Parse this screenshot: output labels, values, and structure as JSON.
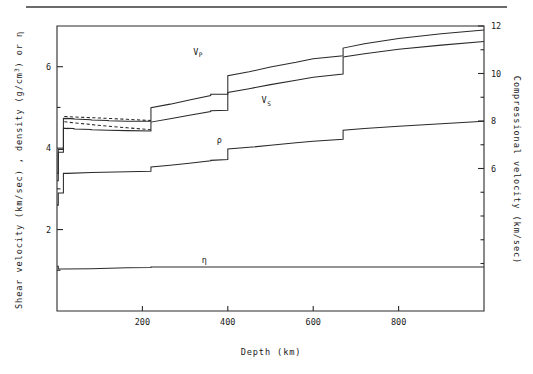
{
  "figure": {
    "background": "#ffffff",
    "ink": "#2a2a2a",
    "top_rule": true
  },
  "chart_data": {
    "type": "line",
    "title": "",
    "xlabel": "Depth (km)",
    "ylabel": "Shear velocity (km/sec) , density (g/cm3) or n",
    "ylabel_parts": {
      "a": "Shear velocity (km/sec) , density (g/cm",
      "sup": "3",
      "b": ") or ",
      "eta": "η"
    },
    "y2label": "Compressional velocity (km/sec)",
    "xlim": [
      0,
      1000
    ],
    "ylim": [
      0,
      7.0
    ],
    "y2lim": [
      0,
      12.0
    ],
    "grid": false,
    "legend": "inline-annotations",
    "xticks": [
      200,
      400,
      600,
      800
    ],
    "xticklabels": [
      "200",
      "400",
      "600",
      "800"
    ],
    "yticks": [
      2,
      4,
      6
    ],
    "yticklabels": [
      "2",
      "4",
      "6"
    ],
    "yminorticks": [
      1,
      3,
      5,
      7
    ],
    "y2ticks": [
      6,
      8,
      10,
      12
    ],
    "y2ticklabels": [
      "6",
      "8",
      "10",
      "12"
    ],
    "y2minorticks": [
      2,
      3,
      4,
      5,
      7,
      9,
      11
    ],
    "annotations": [
      {
        "name": "vp-label",
        "text": "V",
        "sub": "P",
        "x": 330,
        "y": 6.3
      },
      {
        "name": "vs-label",
        "text": "V",
        "sub": "S",
        "x": 490,
        "y": 5.1
      },
      {
        "name": "rho-label",
        "text": "ρ",
        "sub": "",
        "x": 380,
        "y": 4.12
      },
      {
        "name": "eta-label",
        "text": "η",
        "sub": "",
        "x": 345,
        "y": 1.18
      }
    ],
    "series": [
      {
        "name": "Compressional velocity Vp",
        "axis": "right",
        "label": "V_P",
        "style": "solid",
        "points": [
          [
            0,
            5.8
          ],
          [
            3,
            5.8
          ],
          [
            3,
            6.8
          ],
          [
            15,
            6.8
          ],
          [
            15,
            8.11
          ],
          [
            24.4,
            8.1
          ],
          [
            24.4,
            8.11
          ],
          [
            40,
            8.09
          ],
          [
            40,
            8.08
          ],
          [
            80,
            8.05
          ],
          [
            80,
            8.04
          ],
          [
            120,
            8.02
          ],
          [
            120,
            8.01
          ],
          [
            165,
            7.99
          ],
          [
            165,
            7.99
          ],
          [
            220,
            7.99
          ],
          [
            220,
            8.56
          ],
          [
            265,
            8.71
          ],
          [
            265,
            8.71
          ],
          [
            310,
            8.88
          ],
          [
            310,
            8.88
          ],
          [
            360,
            9.07
          ],
          [
            360,
            9.13
          ],
          [
            400,
            9.13
          ],
          [
            400,
            9.91
          ],
          [
            450,
            10.07
          ],
          [
            450,
            10.07
          ],
          [
            500,
            10.27
          ],
          [
            500,
            10.27
          ],
          [
            560,
            10.47
          ],
          [
            560,
            10.47
          ],
          [
            600,
            10.62
          ],
          [
            600,
            10.62
          ],
          [
            670,
            10.75
          ],
          [
            670,
            11.07
          ],
          [
            720,
            11.25
          ],
          [
            720,
            11.25
          ],
          [
            800,
            11.47
          ],
          [
            800,
            11.47
          ],
          [
            900,
            11.67
          ],
          [
            900,
            11.67
          ],
          [
            1000,
            11.83
          ]
        ]
      },
      {
        "name": "Compressional velocity Vp anisotropic (dashed)",
        "axis": "right",
        "label": "V_P horizontal",
        "style": "dashed",
        "points": [
          [
            17,
            8.19
          ],
          [
            40,
            8.17
          ],
          [
            80,
            8.14
          ],
          [
            120,
            8.11
          ],
          [
            165,
            8.07
          ],
          [
            220,
            8.02
          ]
        ]
      },
      {
        "name": "Shear velocity Vs",
        "axis": "left",
        "label": "V_S",
        "style": "solid",
        "points": [
          [
            0,
            3.2
          ],
          [
            3,
            3.2
          ],
          [
            3,
            3.9
          ],
          [
            15,
            3.9
          ],
          [
            15,
            4.49
          ],
          [
            24.4,
            4.48
          ],
          [
            24.4,
            4.49
          ],
          [
            40,
            4.48
          ],
          [
            40,
            4.47
          ],
          [
            80,
            4.46
          ],
          [
            80,
            4.45
          ],
          [
            120,
            4.44
          ],
          [
            120,
            4.44
          ],
          [
            165,
            4.43
          ],
          [
            165,
            4.43
          ],
          [
            220,
            4.42
          ],
          [
            220,
            4.64
          ],
          [
            265,
            4.72
          ],
          [
            265,
            4.72
          ],
          [
            310,
            4.81
          ],
          [
            310,
            4.81
          ],
          [
            360,
            4.9
          ],
          [
            360,
            4.92
          ],
          [
            400,
            4.93
          ],
          [
            400,
            5.37
          ],
          [
            450,
            5.46
          ],
          [
            450,
            5.46
          ],
          [
            500,
            5.56
          ],
          [
            500,
            5.56
          ],
          [
            560,
            5.67
          ],
          [
            560,
            5.67
          ],
          [
            600,
            5.74
          ],
          [
            600,
            5.74
          ],
          [
            670,
            5.82
          ],
          [
            670,
            6.24
          ],
          [
            720,
            6.32
          ],
          [
            720,
            6.32
          ],
          [
            800,
            6.43
          ],
          [
            800,
            6.43
          ],
          [
            900,
            6.53
          ],
          [
            900,
            6.53
          ],
          [
            1000,
            6.62
          ]
        ]
      },
      {
        "name": "Shear velocity Vs anisotropic (dashed)",
        "axis": "left",
        "label": "V_S horizontal",
        "style": "dashed",
        "points": [
          [
            17,
            4.65
          ],
          [
            40,
            4.62
          ],
          [
            80,
            4.58
          ],
          [
            120,
            4.54
          ],
          [
            165,
            4.5
          ],
          [
            220,
            4.45
          ]
        ]
      },
      {
        "name": "Density rho",
        "axis": "left",
        "label": "rho",
        "style": "solid",
        "points": [
          [
            0,
            2.6
          ],
          [
            3,
            2.6
          ],
          [
            3,
            2.9
          ],
          [
            15,
            2.9
          ],
          [
            15,
            3.38
          ],
          [
            24.4,
            3.38
          ],
          [
            24.4,
            3.38
          ],
          [
            80,
            3.4
          ],
          [
            80,
            3.4
          ],
          [
            165,
            3.42
          ],
          [
            165,
            3.42
          ],
          [
            220,
            3.43
          ],
          [
            220,
            3.54
          ],
          [
            265,
            3.58
          ],
          [
            265,
            3.58
          ],
          [
            310,
            3.63
          ],
          [
            310,
            3.63
          ],
          [
            360,
            3.69
          ],
          [
            360,
            3.7
          ],
          [
            400,
            3.72
          ],
          [
            400,
            3.98
          ],
          [
            450,
            4.02
          ],
          [
            450,
            4.02
          ],
          [
            500,
            4.07
          ],
          [
            500,
            4.07
          ],
          [
            560,
            4.13
          ],
          [
            560,
            4.13
          ],
          [
            600,
            4.17
          ],
          [
            600,
            4.17
          ],
          [
            670,
            4.22
          ],
          [
            670,
            4.44
          ],
          [
            720,
            4.48
          ],
          [
            720,
            4.48
          ],
          [
            800,
            4.54
          ],
          [
            800,
            4.54
          ],
          [
            900,
            4.6
          ],
          [
            900,
            4.6
          ],
          [
            1000,
            4.66
          ]
        ]
      },
      {
        "name": "Eta parameter",
        "axis": "left",
        "label": "eta",
        "style": "solid",
        "points": [
          [
            0,
            1.1
          ],
          [
            3,
            1.1
          ],
          [
            3,
            1.03
          ],
          [
            15,
            1.03
          ],
          [
            15,
            1.03
          ],
          [
            80,
            1.04
          ],
          [
            80,
            1.04
          ],
          [
            165,
            1.06
          ],
          [
            165,
            1.06
          ],
          [
            220,
            1.07
          ],
          [
            220,
            1.08
          ],
          [
            400,
            1.08
          ],
          [
            400,
            1.08
          ],
          [
            670,
            1.08
          ],
          [
            670,
            1.08
          ],
          [
            1000,
            1.08
          ]
        ]
      }
    ]
  }
}
